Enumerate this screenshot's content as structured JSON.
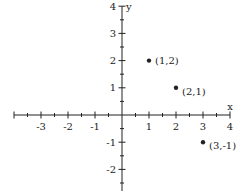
{
  "chart_data": {
    "type": "scatter",
    "title": "",
    "xlabel": "x",
    "ylabel": "y",
    "xlim": [
      -4,
      4
    ],
    "ylim": [
      -2.8,
      4
    ],
    "x_ticks": [
      -3,
      -2,
      -1,
      1,
      2,
      3,
      4
    ],
    "y_ticks": [
      -2,
      -1,
      1,
      2,
      3,
      4
    ],
    "minor_tick_step": 0.5,
    "grid": false,
    "points": [
      {
        "x": 1,
        "y": 2,
        "label": "(1,2)"
      },
      {
        "x": 2,
        "y": 1,
        "label": "(2,1)"
      },
      {
        "x": 3,
        "y": -1,
        "label": "(3,-1)"
      }
    ],
    "colors": {
      "ink": "#222222"
    }
  }
}
